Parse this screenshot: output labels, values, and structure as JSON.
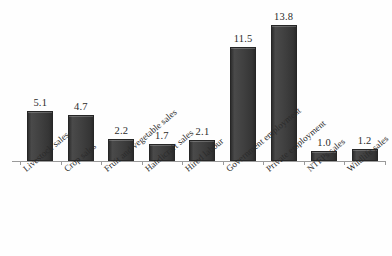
{
  "chart_data": {
    "type": "bar",
    "title": "",
    "subtitle": "",
    "xlabel": "",
    "ylabel": "",
    "categories": [
      "Livestock sales",
      "Crop sales",
      "Fruit and vegetable sales",
      "Handicraft sales",
      "Hired labour",
      "Government employment",
      "Private employment",
      "NTFPs sales",
      "Wildlife sales"
    ],
    "values": [
      5.1,
      4.7,
      2.2,
      1.7,
      2.1,
      11.5,
      13.8,
      1.0,
      1.2
    ],
    "value_labels": [
      "5.1",
      "4.7",
      "2.2",
      "1.7",
      "2.1",
      "11.5",
      "13.8",
      "1.0",
      "1.2"
    ],
    "ylim": [
      0,
      15.5
    ],
    "grid": false,
    "legend": false,
    "legend_position": "none",
    "y_axis_visible": false,
    "x_axis_visible": true,
    "bar_color": "#3d3d3d",
    "bar_edge_color": "#262626",
    "axis_color": "#9a9a9a",
    "background_color": "#fefefe",
    "text_color": "#2b2b2b",
    "label_rotation_deg": -40
  }
}
